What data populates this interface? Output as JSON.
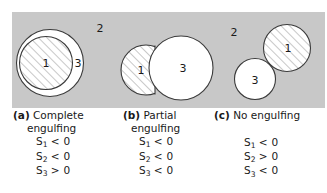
{
  "figure": {
    "background_color": "#c8c8c8",
    "phase_labels": {
      "hatched_phase": "1",
      "matrix_phase": "2",
      "white_phase": "3"
    },
    "panels": [
      {
        "key": "a",
        "label": "(a)",
        "title_line1": "Complete",
        "title_line2": "engulfing",
        "medium_label": "2",
        "circle_labels": {
          "hatched": "1",
          "white": "3"
        },
        "conditions": [
          {
            "symbol": "S",
            "sub": "1",
            "op": "<",
            "value": "0"
          },
          {
            "symbol": "S",
            "sub": "2",
            "op": "<",
            "value": "0"
          },
          {
            "symbol": "S",
            "sub": "3",
            "op": ">",
            "value": "0"
          }
        ]
      },
      {
        "key": "b",
        "label": "(b)",
        "title_line1": "Partial",
        "title_line2": "engulfing",
        "medium_label": "",
        "circle_labels": {
          "hatched": "1",
          "white": "3"
        },
        "conditions": [
          {
            "symbol": "S",
            "sub": "1",
            "op": "<",
            "value": "0"
          },
          {
            "symbol": "S",
            "sub": "2",
            "op": "<",
            "value": "0"
          },
          {
            "symbol": "S",
            "sub": "3",
            "op": "<",
            "value": "0"
          }
        ]
      },
      {
        "key": "c",
        "label": "(c)",
        "title_line1": "No engulfing",
        "title_line2": "",
        "medium_label": "2",
        "circle_labels": {
          "hatched": "1",
          "white": "3"
        },
        "conditions": [
          {
            "symbol": "S",
            "sub": "1",
            "op": "<",
            "value": "0"
          },
          {
            "symbol": "S",
            "sub": "2",
            "op": ">",
            "value": "0"
          },
          {
            "symbol": "S",
            "sub": "3",
            "op": "<",
            "value": "0"
          }
        ]
      }
    ]
  }
}
